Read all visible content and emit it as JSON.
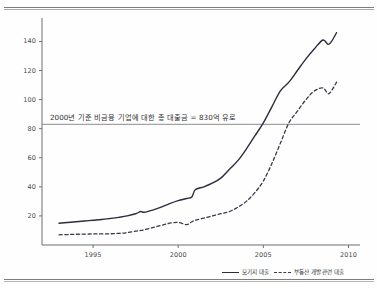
{
  "page": {
    "background_color": "#fefefe",
    "rule_color": "#7d7d7d"
  },
  "annotation": {
    "text": "2000년 기준 비금융 기업에 대한 총 대출금 = 830억 유로",
    "value": 83,
    "line_color": "#8d8d8d"
  },
  "legend": {
    "position": "bottom-right",
    "entries": [
      {
        "label": "모기지 대출",
        "style": "solid",
        "color": "#2c2c3c"
      },
      {
        "label": "부동산 개발 관련 대출",
        "style": "dashed",
        "color": "#3a3a4a"
      }
    ]
  },
  "chart_data": {
    "type": "line",
    "title": "",
    "subtitle": "",
    "xlabel": "",
    "ylabel": "",
    "xlim": [
      1992.0,
      2010.5
    ],
    "ylim": [
      0,
      152
    ],
    "grid": false,
    "legend_position": "bottom-right",
    "xticks": [
      1995,
      2000,
      2005,
      2010
    ],
    "xtick_labels": [
      "1995",
      "2000",
      "2005",
      "2010"
    ],
    "yticks": [
      20,
      40,
      60,
      80,
      100,
      120,
      140
    ],
    "ytick_labels": [
      "20",
      "40",
      "60",
      "80",
      "100",
      "120",
      "140"
    ],
    "annotations": [
      {
        "type": "hline",
        "y": 83,
        "label": "2000년 기준 비금융 기업에 대한 총 대출금 = 830억 유로"
      }
    ],
    "x": [
      1993.0,
      1993.5,
      1994.0,
      1994.5,
      1995.0,
      1995.5,
      1996.0,
      1996.5,
      1997.0,
      1997.5,
      1997.8,
      1998.0,
      1998.5,
      1999.0,
      1999.5,
      2000.0,
      2000.5,
      2000.8,
      2001.0,
      2001.5,
      2002.0,
      2002.5,
      2003.0,
      2003.5,
      2004.0,
      2004.5,
      2005.0,
      2005.5,
      2006.0,
      2006.5,
      2007.0,
      2007.5,
      2008.0,
      2008.5,
      2008.8,
      2009.0,
      2009.3
    ],
    "series": [
      {
        "name": "모기지 대출",
        "style": "solid",
        "color": "#2c2c3c",
        "values": [
          15,
          15.5,
          16,
          16.5,
          17,
          17.5,
          18.2,
          19,
          20,
          21.5,
          23,
          22.5,
          24,
          26,
          28.5,
          30.5,
          32,
          33,
          38,
          40,
          42.5,
          46,
          52,
          58,
          66,
          75,
          84,
          95,
          106,
          112,
          120,
          128,
          135,
          141,
          138,
          140,
          146
        ]
      },
      {
        "name": "부동산 개발 관련 대출",
        "style": "dashed",
        "color": "#3a3a4a",
        "values": [
          7,
          7.2,
          7.4,
          7.5,
          7.6,
          7.6,
          7.7,
          8,
          8.5,
          9.5,
          10,
          10.5,
          12,
          13.5,
          15,
          15.5,
          14,
          16,
          17,
          18.5,
          20,
          21.5,
          23,
          26,
          30,
          36,
          44,
          56,
          70,
          84,
          92,
          100,
          106,
          108,
          104,
          106,
          112
        ]
      }
    ]
  }
}
